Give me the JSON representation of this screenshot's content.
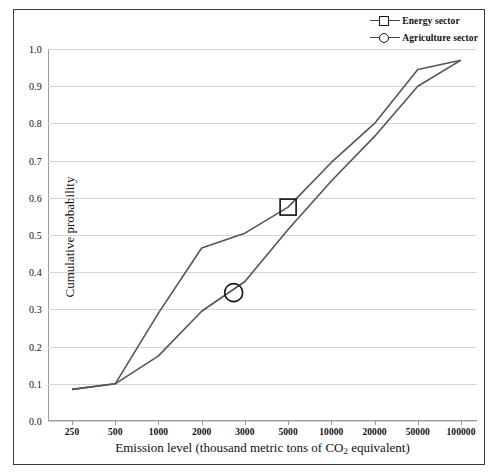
{
  "chart_data": {
    "type": "line",
    "title": "",
    "xlabel": "Emission level (thousand metric tons of CO2 equivalent)",
    "xlabel_prefix": "Emission level (thousand metric tons of CO",
    "xlabel_sub": "2",
    "xlabel_suffix": " equivalent)",
    "ylabel": "Cumulative probability",
    "x_scale": "log-categorical",
    "categories": [
      "250",
      "500",
      "1000",
      "2000",
      "3000",
      "5000",
      "10000",
      "20000",
      "50000",
      "100000"
    ],
    "x_values": [
      250,
      500,
      1000,
      2000,
      3000,
      5000,
      10000,
      20000,
      50000,
      100000
    ],
    "ylim": [
      0.0,
      1.0
    ],
    "y_ticks": [
      "0.0",
      "0.1",
      "0.2",
      "0.3",
      "0.4",
      "0.5",
      "0.6",
      "0.7",
      "0.8",
      "0.9",
      "1.0"
    ],
    "y_tick_values": [
      0.0,
      0.1,
      0.2,
      0.3,
      0.4,
      0.5,
      0.6,
      0.7,
      0.8,
      0.9,
      1.0
    ],
    "grid": "horizontal",
    "legend_position": "top-right",
    "series": [
      {
        "name": "Energy sector",
        "marker": "square",
        "color": "#555555",
        "values": [
          0.085,
          0.1,
          0.29,
          0.465,
          0.505,
          0.575,
          0.695,
          0.8,
          0.945,
          0.97
        ],
        "marker_point": {
          "x": 5000,
          "y": 0.575
        }
      },
      {
        "name": "Agriculture sector",
        "marker": "circle",
        "color": "#555555",
        "values": [
          0.085,
          0.1,
          0.175,
          0.295,
          0.375,
          0.515,
          0.645,
          0.765,
          0.9,
          0.97
        ],
        "marker_point": {
          "x": 2700,
          "y": 0.345
        }
      }
    ]
  },
  "legend": {
    "items": [
      {
        "label": "Energy sector",
        "marker": "square"
      },
      {
        "label": "Agriculture sector",
        "marker": "circle"
      }
    ]
  },
  "colors": {
    "line": "#555555",
    "grid": "#d4d4d4",
    "axis": "#9a9a9a",
    "border": "#3a3a3a",
    "text": "#111111",
    "background": "#ffffff"
  }
}
